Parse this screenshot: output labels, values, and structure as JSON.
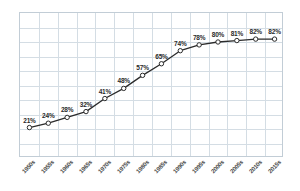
{
  "chart_data": {
    "type": "line",
    "title": "",
    "subtitle": "",
    "xlabel": "",
    "ylabel": "",
    "categories": [
      "1950s",
      "1955s",
      "1960s",
      "1965s",
      "1970s",
      "1975s",
      "1980s",
      "1985s",
      "1990s",
      "1995s",
      "2000s",
      "2005s",
      "2010s",
      "2015s"
    ],
    "values": [
      21,
      24,
      28,
      32,
      41,
      48,
      57,
      65,
      74,
      78,
      80,
      81,
      82,
      82
    ],
    "point_labels": [
      "21%",
      "24%",
      "28%",
      "32%",
      "41%",
      "48%",
      "57%",
      "65%",
      "74%",
      "78%",
      "80%",
      "81%",
      "82%",
      "82%"
    ],
    "ylim": [
      0,
      100
    ],
    "xlim_categories": 14,
    "grid": true,
    "legend": "none",
    "series": [
      {
        "name": "",
        "values": [
          21,
          24,
          28,
          32,
          41,
          48,
          57,
          65,
          74,
          78,
          80,
          81,
          82,
          82
        ]
      }
    ],
    "style": {
      "line_color": "#2b2b2b",
      "marker_fill": "#ffffff",
      "marker_edge": "#2b2b2b",
      "grid_color": "#d4dde4",
      "frame_color": "#c2cdd6",
      "label_color": "#2b2b2b",
      "tick_color": "#4a4a4a",
      "background": "#ffffff"
    }
  }
}
